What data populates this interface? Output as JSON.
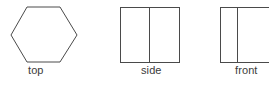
{
  "drawing": {
    "title": "Orthographic views",
    "background_color": "#ffffff",
    "line_color": "#4a4a4a",
    "label_color": "#3b3b3b",
    "line_width": 1,
    "views": [
      {
        "id": "top",
        "label": "top",
        "shape": "hexagon",
        "description": "Regular hexagon with flat top and bottom edges",
        "bounds": {
          "x": 10,
          "y": 6,
          "width": 68,
          "height": 57
        },
        "points": "17,6 51,6 68,34.5 51,62 17,62 0,34.5",
        "divider": null
      },
      {
        "id": "side",
        "label": "side",
        "shape": "rectangle-with-vertical-divider",
        "description": "Square divided by a vertical line near the center",
        "bounds": {
          "x": 120,
          "y": 7,
          "width": 59,
          "height": 56
        },
        "divider": {
          "orientation": "vertical",
          "offset_ratio": 0.5
        }
      },
      {
        "id": "front",
        "label": "front",
        "shape": "rectangle-with-vertical-divider",
        "description": "Rectangle divided by a vertical line at about one quarter from the left, clipped by the right image edge",
        "bounds": {
          "x": 220,
          "y": 7,
          "width": 59,
          "height": 56
        },
        "divider": {
          "orientation": "vertical",
          "offset_ratio": 0.28
        }
      }
    ]
  }
}
